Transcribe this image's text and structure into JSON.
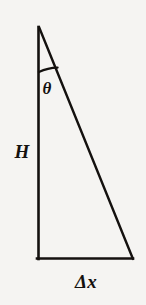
{
  "figure": {
    "kind": "geometry-diagram",
    "background_color": "#f5f4f2",
    "stroke_color": "#14110f",
    "labels": {
      "angle": "θ",
      "height": "H",
      "base": "Δx"
    },
    "geometry": {
      "apex": [
        39,
        27
      ],
      "bottom_left": [
        38,
        259
      ],
      "bottom_right": [
        133,
        259
      ],
      "angle_arc": {
        "center": [
          39,
          27
        ],
        "radius": 45,
        "from_point": [
          39,
          72
        ],
        "to_point": [
          58,
          68
        ]
      }
    }
  }
}
